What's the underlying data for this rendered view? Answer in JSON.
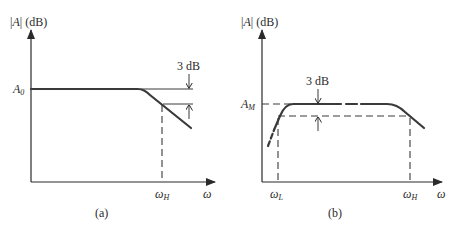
{
  "figure": {
    "panels": [
      {
        "id": "a",
        "caption": "(a)",
        "y_axis_label": {
          "prefix": "|",
          "var": "A",
          "suffix": "| (dB)"
        },
        "x_axis_label": "ω",
        "level_label": {
          "main": "A",
          "sub": "0"
        },
        "cutoff_labels": [
          {
            "main": "ω",
            "sub": "H"
          }
        ],
        "annotation": "3 dB",
        "response_type": "low-pass"
      },
      {
        "id": "b",
        "caption": "(b)",
        "y_axis_label": {
          "prefix": "|",
          "var": "A",
          "suffix": "| (dB)"
        },
        "x_axis_label": "ω",
        "level_label": {
          "main": "A",
          "sub": "M"
        },
        "cutoff_labels": [
          {
            "main": "ω",
            "sub": "L"
          },
          {
            "main": "ω",
            "sub": "H"
          }
        ],
        "annotation": "3 dB",
        "response_type": "band-pass"
      }
    ]
  }
}
